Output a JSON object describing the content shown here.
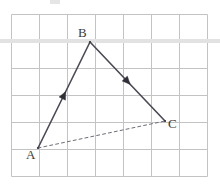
{
  "figure": {
    "canvas": {
      "width": 220,
      "height": 184,
      "background": "#ffffff"
    },
    "grid": {
      "left": 11,
      "top": 14,
      "right": 207,
      "bottom": 176,
      "columns": 7,
      "rows": 6,
      "cell_width": 28,
      "cell_height": 27,
      "line_color": "#c3c3c3",
      "line_width": 1
    },
    "highlight_band": {
      "label": "faint horizontal scan band",
      "y": 39,
      "height": 4,
      "color": "#e2e2e2"
    },
    "top_artifact": {
      "label": "cropped glyph fragment",
      "x": 50,
      "y": 0,
      "width": 10,
      "height": 4,
      "color": "#cfcfcf"
    },
    "points": [
      {
        "name": "A",
        "label": "A",
        "x": 38,
        "y": 148,
        "label_x": 26,
        "label_y": 148
      },
      {
        "name": "B",
        "label": "B",
        "x": 90,
        "y": 42,
        "label_x": 78,
        "label_y": 26
      },
      {
        "name": "C",
        "label": "C",
        "x": 165,
        "y": 121,
        "label_x": 168,
        "label_y": 117
      }
    ],
    "segments": [
      {
        "name": "vector-AB",
        "from": "A",
        "to": "B",
        "style": "solid",
        "color": "#4a4a55",
        "width": 1.6,
        "arrow": {
          "position": 0.5,
          "direction": "toward-B"
        }
      },
      {
        "name": "vector-BC",
        "from": "B",
        "to": "C",
        "style": "solid",
        "color": "#4a4a55",
        "width": 1.6,
        "arrow": {
          "position": 0.5,
          "direction": "toward-C"
        }
      },
      {
        "name": "segment-AC",
        "from": "A",
        "to": "C",
        "style": "dashed",
        "color": "#6d6d78",
        "width": 1.0,
        "dash": "3 3",
        "arrow": null
      }
    ],
    "labels": {
      "A": "A",
      "B": "B",
      "C": "C"
    }
  },
  "chart_data": {
    "type": "scatter",
    "xlabel": "",
    "ylabel": "",
    "grid": true,
    "legend": null,
    "categories": [
      "A",
      "B",
      "C"
    ],
    "x": [
      38,
      90,
      165
    ],
    "y": [
      148,
      42,
      121
    ],
    "series": [
      {
        "name": "vertices",
        "values": [
          [
            38,
            148
          ],
          [
            90,
            42
          ],
          [
            165,
            121
          ]
        ]
      }
    ],
    "annotations": [
      {
        "text": "A",
        "x": 38,
        "y": 148
      },
      {
        "text": "B",
        "x": 90,
        "y": 42
      },
      {
        "text": "C",
        "x": 165,
        "y": 121
      }
    ]
  }
}
